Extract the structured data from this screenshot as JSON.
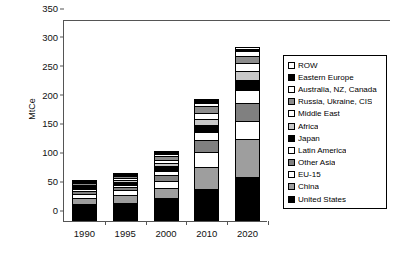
{
  "chart_data": {
    "type": "bar",
    "stacked": true,
    "title": "",
    "xlabel": "",
    "ylabel": "MtCe",
    "categories": [
      "1990",
      "1995",
      "2000",
      "2010",
      "2020"
    ],
    "ylim": [
      0,
      350
    ],
    "yticks": [
      0,
      50,
      100,
      150,
      200,
      250,
      300,
      350
    ],
    "grid": false,
    "legend_position": "right",
    "series": [
      {
        "name": "United States",
        "color": "#000000",
        "values": [
          29,
          32,
          40,
          56,
          77
        ]
      },
      {
        "name": "China",
        "color": "#9e9e9e",
        "values": [
          11,
          13,
          18,
          38,
          65
        ]
      },
      {
        "name": "EU-15",
        "color": "#ffffff",
        "values": [
          7,
          8,
          12,
          25,
          32
        ]
      },
      {
        "name": "Other Asia",
        "color": "#808080",
        "values": [
          5,
          6,
          10,
          21,
          31
        ]
      },
      {
        "name": "Latin America",
        "color": "#ffffff",
        "values": [
          3,
          4,
          7,
          14,
          22
        ]
      },
      {
        "name": "Japan",
        "color": "#000000",
        "values": [
          4,
          5,
          8,
          13,
          17
        ]
      },
      {
        "name": "Africa",
        "color": "#c8c8c8",
        "values": [
          2,
          3,
          5,
          10,
          16
        ]
      },
      {
        "name": "Middle East",
        "color": "#ffffff",
        "values": [
          2,
          3,
          5,
          10,
          14
        ]
      },
      {
        "name": "Russia, Ukraine, CIS",
        "color": "#8c8c8c",
        "values": [
          3,
          4,
          7,
          12,
          12
        ]
      },
      {
        "name": "Australia, NZ, Canada",
        "color": "#ffffff",
        "values": [
          2,
          2,
          4,
          6,
          8
        ]
      },
      {
        "name": "Eastern Europe",
        "color": "#000000",
        "values": [
          1,
          2,
          3,
          4,
          5
        ]
      },
      {
        "name": "ROW",
        "color": "#ffffff",
        "values": [
          1,
          1,
          3,
          3,
          3
        ]
      }
    ],
    "totals": [
      70,
      83,
      122,
      212,
      302
    ]
  },
  "legend": {
    "items": [
      {
        "label": "ROW",
        "color": "#ffffff"
      },
      {
        "label": "Eastern Europe",
        "color": "#000000"
      },
      {
        "label": "Australia, NZ, Canada",
        "color": "#ffffff"
      },
      {
        "label": "Russia, Ukraine, CIS",
        "color": "#8c8c8c"
      },
      {
        "label": "Middle East",
        "color": "#ffffff"
      },
      {
        "label": "Africa",
        "color": "#c8c8c8"
      },
      {
        "label": "Japan",
        "color": "#000000"
      },
      {
        "label": "Latin America",
        "color": "#ffffff"
      },
      {
        "label": "Other Asia",
        "color": "#808080"
      },
      {
        "label": "EU-15",
        "color": "#ffffff"
      },
      {
        "label": "China",
        "color": "#9e9e9e"
      },
      {
        "label": "United States",
        "color": "#000000"
      }
    ]
  }
}
